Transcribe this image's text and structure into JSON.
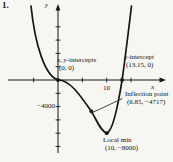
{
  "page": {
    "problem_number": "1."
  },
  "chart_data": {
    "type": "line",
    "title": "",
    "xlabel": "x",
    "ylabel": "y",
    "grid": false,
    "legend": "none",
    "xlim": [
      -10.3,
      21.6
    ],
    "ylim": [
      -11500,
      11500
    ],
    "x_ticks": [
      -5,
      5,
      10,
      15
    ],
    "x_tick_label": {
      "value": 10,
      "text": "10"
    },
    "y_ticks": [
      8000,
      6000,
      4000,
      2000,
      -2000,
      -4000,
      -6000,
      -8000,
      -10000
    ],
    "y_tick_label": {
      "value": -4000,
      "text": "−4000"
    },
    "curve": {
      "start": [
        -5.54,
        11128
      ],
      "cubics": [
        [
          -4.72,
          5264,
          -2.67,
          602,
          0,
          0
        ],
        [
          2.46,
          0,
          4.51,
          -2256,
          6.85,
          -4717
        ],
        [
          8.01,
          -6166,
          8.83,
          -7745,
          10,
          -8000
        ],
        [
          11.08,
          -7820,
          12.11,
          -4812,
          13.15,
          0
        ],
        [
          13.86,
          3609,
          14.47,
          7369,
          15.09,
          11128
        ]
      ]
    },
    "points": [
      {
        "name": "origin-intercept-point",
        "x": 0,
        "y": 0
      },
      {
        "name": "x-intercept-point",
        "x": 13.15,
        "y": 0
      },
      {
        "name": "inflection-point",
        "x": 6.85,
        "y": -4717
      },
      {
        "name": "local-min-point",
        "x": 10,
        "y": -8000
      }
    ],
    "leader_line": {
      "x1": 13.2,
      "y1": -2800,
      "x2": 7.2,
      "y2": -4850
    },
    "annotations": {
      "intercepts": {
        "italic": "x, y",
        "rest": "-intercepts",
        "value": "(0, 0)"
      },
      "x_intercept": {
        "italic": "x",
        "rest": "-intercept",
        "value": "(13.15, 0)"
      },
      "inflection": {
        "title": "Inflection point",
        "value": "(6.85, −4717)"
      },
      "local_min": {
        "title": "Local min",
        "value": "(10, −8000)"
      }
    },
    "ink_color": "#151515",
    "background_color": "#f6f6f3"
  }
}
